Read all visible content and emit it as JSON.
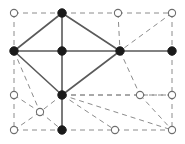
{
  "figure": {
    "width": 185,
    "height": 144,
    "background": "#ffffff"
  },
  "style": {
    "solid_edge_color": "#5a5a5a",
    "solid_edge_width": 1.6,
    "dashed_edge_color": "#8c8c8c",
    "dashed_edge_width": 1.0,
    "dash_pattern": "5,4",
    "filled_node_fill": "#1a1a1a",
    "filled_node_stroke": "#1a1a1a",
    "open_node_fill": "#ffffff",
    "open_node_stroke": "#6e6e6e",
    "node_radius": 4.2,
    "open_node_radius": 3.6
  },
  "chart_data": {
    "type": "scatter",
    "title": "",
    "xlabel": "",
    "ylabel": "",
    "xlim": [
      0,
      185
    ],
    "ylim": [
      0,
      144
    ],
    "grid": false,
    "legend": null,
    "nodes": [
      {
        "id": "n1",
        "x": 14,
        "y": 13,
        "state": "open",
        "label": "top-left-corner"
      },
      {
        "id": "n2",
        "x": 62,
        "y": 13,
        "state": "filled",
        "label": "top-apex"
      },
      {
        "id": "n3",
        "x": 118,
        "y": 13,
        "state": "open",
        "label": "top-mid-right"
      },
      {
        "id": "n4",
        "x": 172,
        "y": 13,
        "state": "open",
        "label": "top-right-corner"
      },
      {
        "id": "n5",
        "x": 14,
        "y": 51,
        "state": "filled",
        "label": "left-hub"
      },
      {
        "id": "n6",
        "x": 62,
        "y": 51,
        "state": "filled",
        "label": "center-left-hub"
      },
      {
        "id": "n7",
        "x": 120,
        "y": 51,
        "state": "filled",
        "label": "center-right-hub"
      },
      {
        "id": "n8",
        "x": 172,
        "y": 51,
        "state": "filled",
        "label": "right-hub"
      },
      {
        "id": "n9",
        "x": 14,
        "y": 95,
        "state": "open",
        "label": "left-mid-low"
      },
      {
        "id": "n10",
        "x": 62,
        "y": 95,
        "state": "filled",
        "label": "bottom-apex"
      },
      {
        "id": "n11",
        "x": 140,
        "y": 95,
        "state": "open",
        "label": "right-mid-low"
      },
      {
        "id": "n12",
        "x": 172,
        "y": 95,
        "state": "open",
        "label": "right-edge-low"
      },
      {
        "id": "n13",
        "x": 40,
        "y": 112,
        "state": "open",
        "label": "lower-left-inner"
      },
      {
        "id": "n14",
        "x": 14,
        "y": 130,
        "state": "open",
        "label": "bottom-left-corner"
      },
      {
        "id": "n15",
        "x": 62,
        "y": 130,
        "state": "filled",
        "label": "bottom-mid"
      },
      {
        "id": "n16",
        "x": 115,
        "y": 130,
        "state": "open",
        "label": "bottom-mid-right"
      },
      {
        "id": "n17",
        "x": 172,
        "y": 130,
        "state": "open",
        "label": "bottom-right-corner"
      }
    ],
    "edges": [
      {
        "from": "n5",
        "to": "n2",
        "style": "solid"
      },
      {
        "from": "n2",
        "to": "n7",
        "style": "solid"
      },
      {
        "from": "n5",
        "to": "n6",
        "style": "solid"
      },
      {
        "from": "n6",
        "to": "n7",
        "style": "solid"
      },
      {
        "from": "n7",
        "to": "n8",
        "style": "solid"
      },
      {
        "from": "n2",
        "to": "n6",
        "style": "solid"
      },
      {
        "from": "n5",
        "to": "n10",
        "style": "solid"
      },
      {
        "from": "n6",
        "to": "n10",
        "style": "solid"
      },
      {
        "from": "n10",
        "to": "n7",
        "style": "solid"
      },
      {
        "from": "n10",
        "to": "n15",
        "style": "solid"
      },
      {
        "from": "n1",
        "to": "n2",
        "style": "dashed"
      },
      {
        "from": "n2",
        "to": "n3",
        "style": "dashed"
      },
      {
        "from": "n3",
        "to": "n4",
        "style": "dashed"
      },
      {
        "from": "n1",
        "to": "n5",
        "style": "dashed"
      },
      {
        "from": "n3",
        "to": "n7",
        "style": "dashed"
      },
      {
        "from": "n4",
        "to": "n8",
        "style": "dashed"
      },
      {
        "from": "n4",
        "to": "n7",
        "style": "dashed"
      },
      {
        "from": "n5",
        "to": "n9",
        "style": "dashed"
      },
      {
        "from": "n9",
        "to": "n14",
        "style": "dashed"
      },
      {
        "from": "n5",
        "to": "n13",
        "style": "dashed"
      },
      {
        "from": "n9",
        "to": "n13",
        "style": "dashed"
      },
      {
        "from": "n13",
        "to": "n14",
        "style": "dashed"
      },
      {
        "from": "n13",
        "to": "n15",
        "style": "dashed"
      },
      {
        "from": "n10",
        "to": "n13",
        "style": "dashed"
      },
      {
        "from": "n14",
        "to": "n15",
        "style": "dashed"
      },
      {
        "from": "n15",
        "to": "n16",
        "style": "dashed"
      },
      {
        "from": "n16",
        "to": "n17",
        "style": "dashed"
      },
      {
        "from": "n10",
        "to": "n16",
        "style": "dashed"
      },
      {
        "from": "n10",
        "to": "n17",
        "style": "dashed"
      },
      {
        "from": "n10",
        "to": "n11",
        "style": "dashed"
      },
      {
        "from": "n10",
        "to": "n12",
        "style": "dashed"
      },
      {
        "from": "n11",
        "to": "n12",
        "style": "dashed"
      },
      {
        "from": "n11",
        "to": "n17",
        "style": "dashed"
      },
      {
        "from": "n7",
        "to": "n11",
        "style": "dashed"
      },
      {
        "from": "n8",
        "to": "n12",
        "style": "dashed"
      },
      {
        "from": "n12",
        "to": "n17",
        "style": "dashed"
      }
    ]
  }
}
